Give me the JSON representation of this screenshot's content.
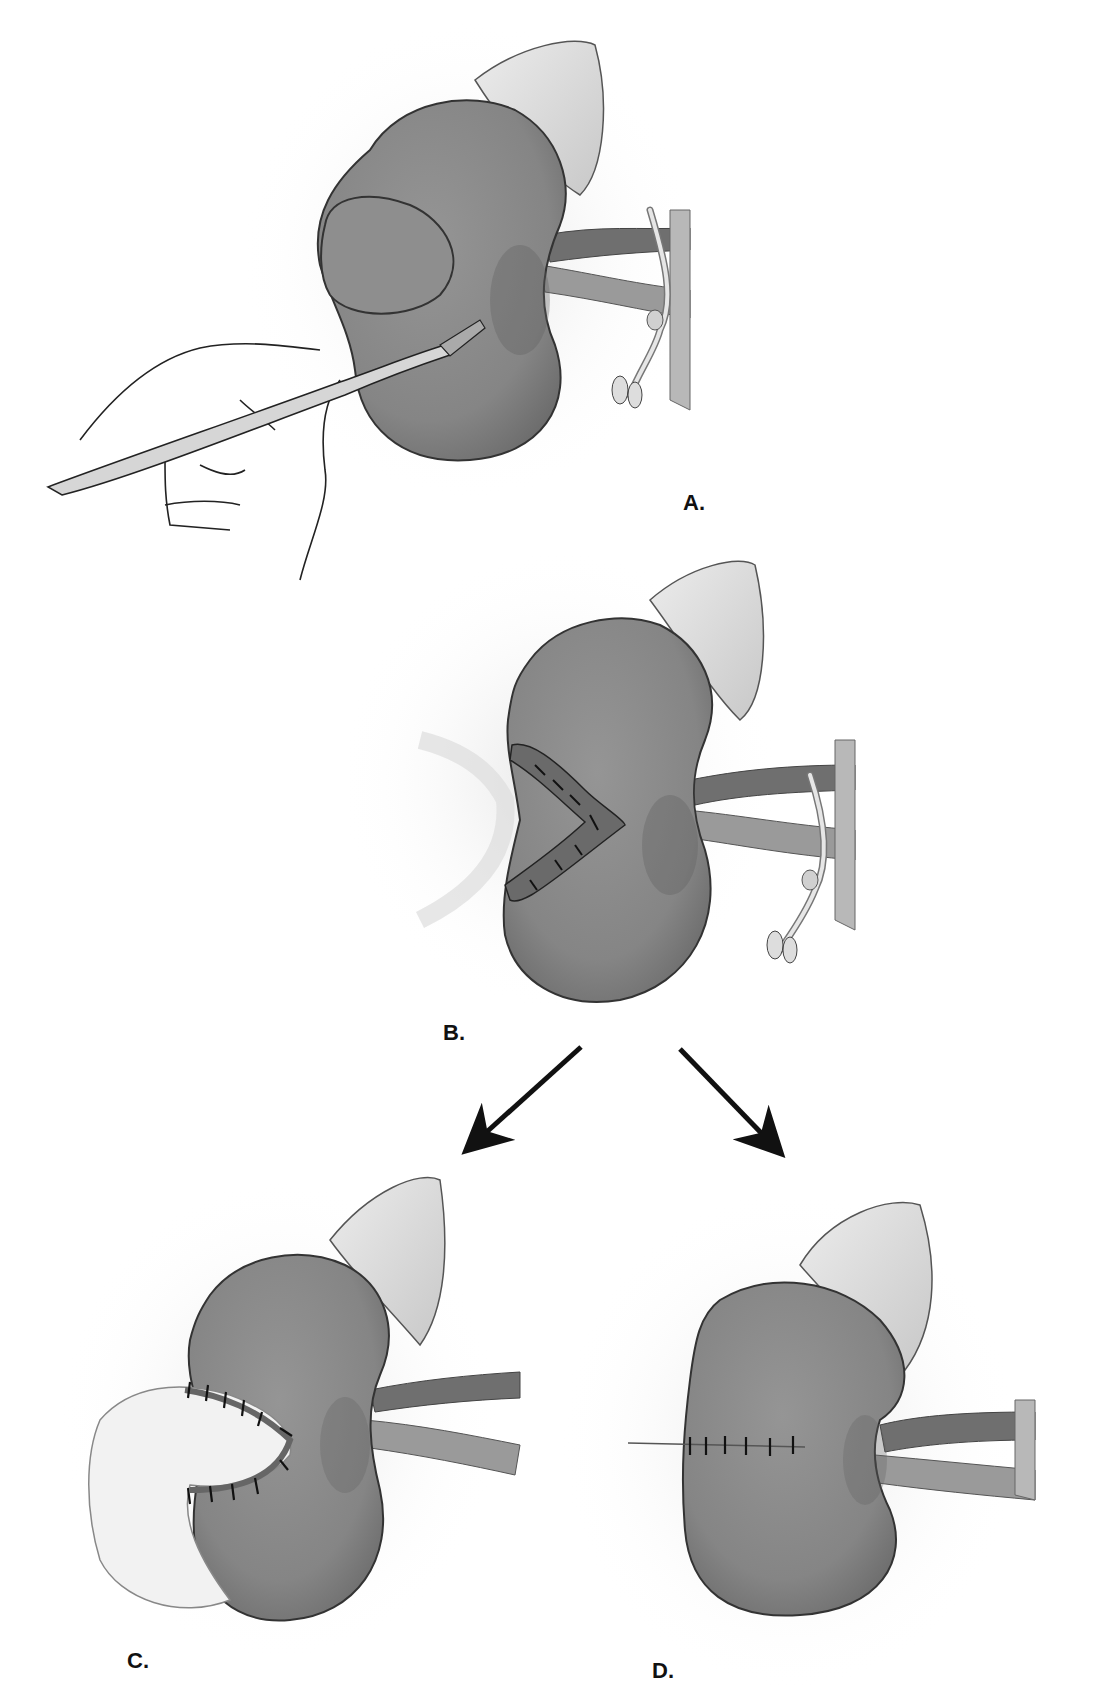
{
  "figure": {
    "colors": {
      "background": "#ffffff",
      "kidney": "#8a8a8a",
      "kidney_shade": "#6e6e6e",
      "adrenal": "#d8d8d8",
      "vessel": "#7a7a7a",
      "outline": "#333333",
      "arrow": "#111111",
      "label": "#111111"
    },
    "panels": [
      {
        "id": "A",
        "label": "A.",
        "description": "Hand holding scalpel excising a tumor from the upper-left pole of the kidney; renal hilum vessels clamped"
      },
      {
        "id": "B",
        "label": "B.",
        "description": "Kidney with V-shaped wedge defect after excision; internal sutures visible; vessels clamped"
      },
      {
        "id": "C",
        "label": "C.",
        "description": "Defect closed with interrupted sutures over a fat/omental bolster"
      },
      {
        "id": "D",
        "label": "D.",
        "description": "Defect closed with a single row of interrupted sutures; clamp removed"
      }
    ],
    "arrows": [
      {
        "from": "B",
        "to": "C",
        "direction": "down-left"
      },
      {
        "from": "B",
        "to": "D",
        "direction": "down-right"
      }
    ],
    "caption": "",
    "caption_note": "caption line is cropped at the bottom edge and not legible"
  }
}
